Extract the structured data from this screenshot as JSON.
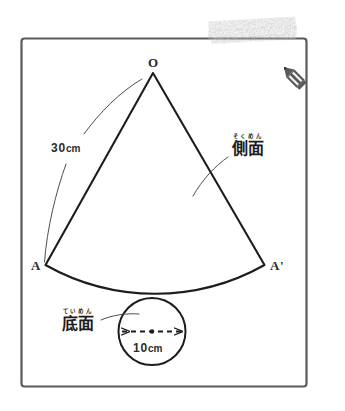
{
  "figure": {
    "title_alt": "cone-net-diagram",
    "frame": {
      "stroke_color": "#5a5a5a"
    },
    "apex_label": "O",
    "left_point_label": "A",
    "right_point_label": "A'",
    "slant_length_value": "30",
    "slant_length_unit": "cm",
    "diameter_value": "10",
    "diameter_unit": "cm",
    "lateral_face": {
      "ruby": "そくめん",
      "base": "側面"
    },
    "base_face": {
      "ruby": "ていめん",
      "base": "底面"
    },
    "ink_color": "#1d1d1d",
    "marker_color": "#8c8c8c",
    "pencil_color": "#595959"
  }
}
